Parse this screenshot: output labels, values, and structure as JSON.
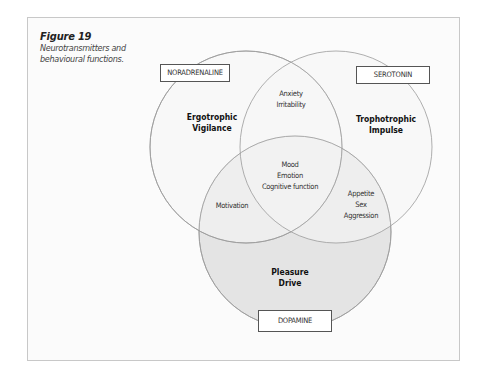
{
  "figure": {
    "title": "Figure 19",
    "subtitle_line1": "Neurotransmitters and",
    "subtitle_line2": "behavioural functions."
  },
  "sets": {
    "noradrenaline": {
      "label": "NORADRENALINE",
      "function_line1": "Ergotrophic",
      "function_line2": "Vigilance"
    },
    "serotonin": {
      "label": "SEROTONIN",
      "function_line1": "Trophotrophic",
      "function_line2": "Impulse"
    },
    "dopamine": {
      "label": "DOPAMINE",
      "function_line1": "Pleasure",
      "function_line2": "Drive"
    }
  },
  "intersections": {
    "noradrenaline_serotonin": [
      "Anxiety",
      "Irritability"
    ],
    "noradrenaline_dopamine": [
      "Motivation"
    ],
    "serotonin_dopamine": [
      "Appetite",
      "Sex",
      "Aggression"
    ],
    "all_three": [
      "Mood",
      "Emotion",
      "Cognitive function"
    ]
  },
  "colors": {
    "circle_stroke": "#9a9a9a",
    "dopamine_fill": "#e4e4e4",
    "frame_border": "#c8c8c8",
    "box_border": "#555555"
  }
}
